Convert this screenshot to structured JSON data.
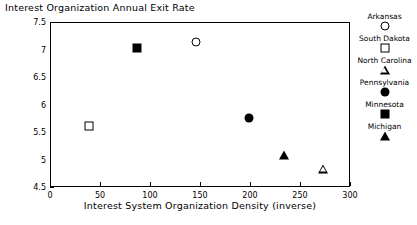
{
  "chart_data": {
    "type": "scatter",
    "title": "Interest Organization Annual Exit Rate",
    "xlabel": "Interest System Organization Density (inverse)",
    "ylabel": "",
    "xlim": [
      0,
      300
    ],
    "ylim": [
      4.5,
      7.5
    ],
    "xticks": [
      0,
      50,
      100,
      150,
      200,
      250,
      300
    ],
    "xtick_labels": [
      "0",
      "50",
      "100",
      "150",
      "200",
      "250",
      "300"
    ],
    "yticks": [
      4.5,
      5,
      5.5,
      6,
      6.5,
      7,
      7.5
    ],
    "ytick_labels": [
      "4.5",
      "5",
      "5.5",
      "6",
      "6.5",
      "7",
      "7.5"
    ],
    "grid": false,
    "legend_position": "right",
    "points": [
      {
        "name": "Arkansas",
        "x": 145,
        "y": 7.15,
        "marker": "circle-open"
      },
      {
        "name": "South Dakota",
        "x": 38,
        "y": 5.63,
        "marker": "square-open"
      },
      {
        "name": "North Carolina",
        "x": 272,
        "y": 4.85,
        "marker": "triangle-open"
      },
      {
        "name": "Pennsylvania",
        "x": 198,
        "y": 5.77,
        "marker": "circle-filled"
      },
      {
        "name": "Minnesota",
        "x": 86,
        "y": 7.05,
        "marker": "square-filled"
      },
      {
        "name": "Michigan",
        "x": 233,
        "y": 5.1,
        "marker": "triangle-filled"
      }
    ],
    "series": [
      {
        "name": "Arkansas",
        "values": [
          {
            "x": 145,
            "y": 7.15
          }
        ]
      },
      {
        "name": "South Dakota",
        "values": [
          {
            "x": 38,
            "y": 5.63
          }
        ]
      },
      {
        "name": "North Carolina",
        "values": [
          {
            "x": 272,
            "y": 4.85
          }
        ]
      },
      {
        "name": "Pennsylvania",
        "values": [
          {
            "x": 198,
            "y": 5.77
          }
        ]
      },
      {
        "name": "Minnesota",
        "values": [
          {
            "x": 86,
            "y": 7.05
          }
        ]
      },
      {
        "name": "Michigan",
        "values": [
          {
            "x": 233,
            "y": 5.1
          }
        ]
      }
    ],
    "legend": [
      {
        "label": "Arkansas",
        "marker": "circle-open"
      },
      {
        "label": "South Dakota",
        "marker": "square-open"
      },
      {
        "label": "North Carolina",
        "marker": "triangle-open"
      },
      {
        "label": "Pennsylvania",
        "marker": "circle-filled"
      },
      {
        "label": "Minnesota",
        "marker": "square-filled"
      },
      {
        "label": "Michigan",
        "marker": "triangle-filled"
      }
    ],
    "colors": {
      "marker": "#000000",
      "axis": "#000000",
      "background": "#ffffff"
    }
  }
}
